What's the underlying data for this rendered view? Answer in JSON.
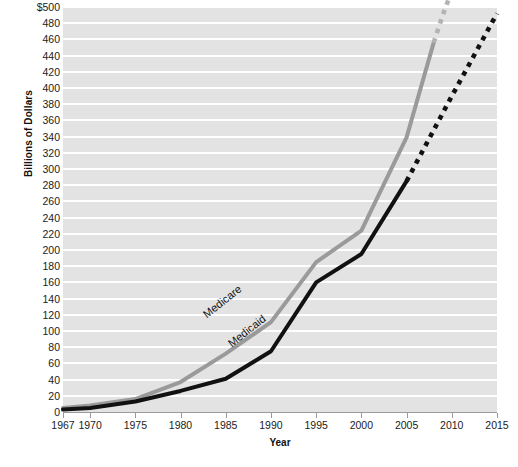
{
  "chart_data": {
    "type": "line",
    "title": "",
    "xlabel": "Year",
    "ylabel": "Billions of Dollars",
    "xlim": [
      1967,
      2015
    ],
    "ylim": [
      0,
      500
    ],
    "grid": true,
    "legend_position": "inline-on-lines",
    "y_ticks": [
      "$500",
      "480",
      "460",
      "440",
      "420",
      "400",
      "380",
      "360",
      "340",
      "320",
      "300",
      "280",
      "260",
      "240",
      "220",
      "200",
      "180",
      "160",
      "140",
      "120",
      "100",
      "80",
      "60",
      "40",
      "20",
      "0"
    ],
    "y_tick_values": [
      500,
      480,
      460,
      440,
      420,
      400,
      380,
      360,
      340,
      320,
      300,
      280,
      260,
      240,
      220,
      200,
      180,
      160,
      140,
      120,
      100,
      80,
      60,
      40,
      20,
      0
    ],
    "x_ticks": [
      "1967",
      "1970",
      "1975",
      "1980",
      "1985",
      "1990",
      "1995",
      "2000",
      "2005",
      "2010",
      "2015"
    ],
    "x_tick_values": [
      1967,
      1970,
      1975,
      1980,
      1985,
      1990,
      1995,
      2000,
      2005,
      2010,
      2015
    ],
    "series": [
      {
        "name": "Medicare",
        "color": "#9a9a9a",
        "style": "solid",
        "x": [
          1967,
          1970,
          1975,
          1980,
          1985,
          1990,
          1995,
          2000,
          2005,
          2008
        ],
        "values": [
          5,
          8,
          16,
          37,
          72,
          111,
          185,
          224,
          339,
          456
        ]
      },
      {
        "name": "Medicare (projected)",
        "color": "#b3b3b3",
        "style": "dotted",
        "x": [
          2008,
          2009,
          2010
        ],
        "values": [
          456,
          490,
          520
        ]
      },
      {
        "name": "Medicaid",
        "color": "#111111",
        "style": "solid",
        "x": [
          1967,
          1970,
          1975,
          1980,
          1985,
          1990,
          1995,
          2000,
          2005
        ],
        "values": [
          3,
          5,
          13,
          26,
          41,
          75,
          160,
          195,
          285
        ]
      },
      {
        "name": "Medicaid (projected)",
        "color": "#111111",
        "style": "dotted",
        "x": [
          2005,
          2010,
          2015
        ],
        "values": [
          285,
          390,
          492
        ]
      }
    ],
    "annotations": [
      {
        "name": "Medicare",
        "text": "Medicare",
        "near_x": 1991,
        "near_y": 130
      },
      {
        "name": "Medicaid",
        "text": "Medicaid",
        "near_x": 1993,
        "near_y": 100
      }
    ]
  },
  "axes": {
    "y_title": "Billions of Dollars",
    "x_title": "Year"
  },
  "caption": {
    "text": ""
  },
  "colors": {
    "medicare": "#9a9a9a",
    "medicaid": "#111111",
    "plot_background": "#e3e3e3",
    "gridline": "#ffffff",
    "axis": "#9a9a9a",
    "text": "#1b1b1b"
  }
}
